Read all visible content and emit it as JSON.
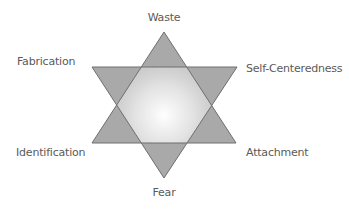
{
  "diagram": {
    "type": "hexagram",
    "labels": {
      "top": "Waste",
      "upper_left": "Fabrication",
      "upper_right": "Self-Centeredness",
      "lower_left": "Identification",
      "lower_right": "Attachment",
      "bottom": "Fear"
    },
    "colors": {
      "triangle_fill": "#a9a9a9",
      "overlap_fill": "#bdbdbd",
      "center_highlight": "#ffffff",
      "outline": "#6e6e6e",
      "label_text": "#5a5a5a",
      "background": "#ffffff"
    },
    "up_triangle": {
      "points": "164,32 92,143 236,143"
    },
    "down_triangle": {
      "points": "92,67 237,67 164,178"
    }
  }
}
